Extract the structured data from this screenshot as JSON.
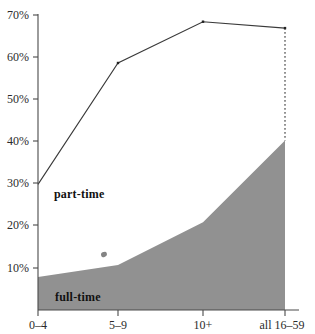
{
  "chart_data": {
    "type": "area",
    "title": "",
    "subtitle": "",
    "xlabel": "",
    "ylabel": "",
    "categories": [
      "0–4",
      "5–9",
      "10+",
      "all 16–59"
    ],
    "x_tick_labels": [
      "0–4",
      "5–9",
      "10+",
      "all 16–59"
    ],
    "y_tick_labels": [
      "10%",
      "20%",
      "30%",
      "40%",
      "50%",
      "60%",
      "70%"
    ],
    "y_tick_values": [
      10,
      20,
      30,
      40,
      50,
      60,
      70
    ],
    "ylim": [
      0,
      70
    ],
    "grid": false,
    "legend_position": "inline-annotations",
    "series": [
      {
        "name": "full-time",
        "label": "full-time",
        "style": "filled-area",
        "fill_color": "#919191",
        "values": [
          7.8,
          10.7,
          20.8,
          40.2
        ]
      },
      {
        "name": "part-time",
        "label": "part-time",
        "style": "line",
        "line_color": "#3a3a3a",
        "values": [
          29.8,
          58.6,
          68.4,
          66.9
        ]
      }
    ],
    "annotations": [
      {
        "text": "part-time",
        "x_category": "0–4",
        "y_value": 24.5
      },
      {
        "text": "full-time",
        "x_category": "0–4",
        "y_value": 2.5
      }
    ],
    "axis_color": "#4a4a4a",
    "marker_color": "#222222",
    "closing_edge_style": "dotted-vertical"
  }
}
